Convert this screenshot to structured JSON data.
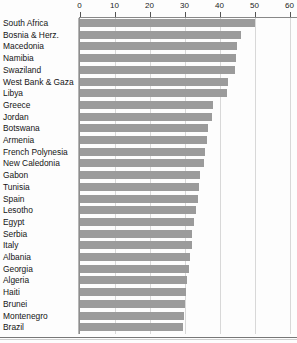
{
  "chart_data": {
    "type": "bar",
    "orientation": "horizontal",
    "title": "",
    "subtitle": "",
    "xlabel": "",
    "ylabel": "",
    "xlim": [
      0,
      60
    ],
    "xticks": [
      0,
      10,
      20,
      30,
      40,
      50,
      60
    ],
    "xtick_labels": [
      "0",
      "10",
      "20",
      "30",
      "40",
      "50",
      "60"
    ],
    "grid": true,
    "legend": null,
    "bar_color": "#9b9b9b",
    "categories": [
      "South Africa",
      "Bosnia & Herz.",
      "Macedonia",
      "Namibia",
      "Swaziland",
      "West Bank & Gaza",
      "Libya",
      "Greece",
      "Jordan",
      "Botswana",
      "Armenia",
      "French Polynesia",
      "New Caledonia",
      "Gabon",
      "Tunisia",
      "Spain",
      "Lesotho",
      "Egypt",
      "Serbia",
      "Italy",
      "Albania",
      "Georgia",
      "Algeria",
      "Haiti",
      "Brunei",
      "Montenegro",
      "Brazil"
    ],
    "values": [
      50.1,
      46.0,
      44.8,
      44.6,
      44.4,
      42.4,
      42.0,
      38.1,
      37.6,
      36.7,
      36.2,
      35.8,
      35.3,
      34.4,
      34.1,
      33.6,
      33.0,
      32.7,
      32.1,
      31.9,
      31.4,
      31.0,
      30.6,
      30.3,
      30.0,
      29.7,
      29.4
    ]
  }
}
